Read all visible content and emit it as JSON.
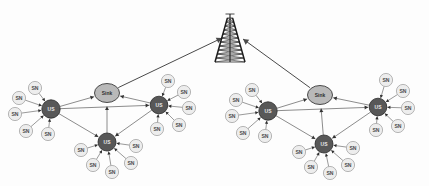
{
  "figure": {
    "background_color": "#fdfdfd",
    "width": 429,
    "height": 186
  },
  "palette": {
    "sn_fill": "#ededed",
    "sn_stroke": "#9a9a9a",
    "us_fill": "#585858",
    "us_stroke": "#2a2a2a",
    "sink_fill": "#b9b9b9",
    "sink_stroke": "#3a3a3a",
    "link_color": "#6f6f6f",
    "uplink_color": "#4a4a4a",
    "tower_color": "#1c1c1c",
    "sn_text": "#4a4a4a",
    "us_text": "#e8e8e8",
    "sink_text": "#2e2e2e"
  },
  "labels": {
    "sensor_node": "SN",
    "cluster_head": "US",
    "sink": "Sink"
  },
  "tower": {
    "name": "base-station-tower",
    "x": 230,
    "y": 18,
    "height": 44,
    "base_half_width": 15,
    "top_half_width": 2.6,
    "rungs": 11
  },
  "clusters": [
    {
      "id": "left-cluster",
      "sink": {
        "id": "sink-left",
        "x": 107,
        "y": 93,
        "rx": 12.5,
        "ry": 9.5,
        "label": "Sink"
      },
      "uplink_to_tower": {
        "from": "sink-left",
        "to_x": 222,
        "to_y": 38
      },
      "hubs": [
        {
          "id": "us-left-west",
          "label": "US",
          "x": 51,
          "y": 109,
          "r": 9.2,
          "sensors": [
            {
              "label": "SN",
              "x": 35,
              "y": 88
            },
            {
              "label": "SN",
              "x": 19,
              "y": 98
            },
            {
              "label": "SN",
              "x": 15,
              "y": 114
            },
            {
              "label": "SN",
              "x": 26,
              "y": 131
            },
            {
              "label": "SN",
              "x": 48,
              "y": 134
            }
          ]
        },
        {
          "id": "us-left-east",
          "label": "US",
          "x": 159,
          "y": 105,
          "r": 8.8,
          "sensors": [
            {
              "label": "SN",
              "x": 168,
              "y": 81
            },
            {
              "label": "SN",
              "x": 184,
              "y": 92
            },
            {
              "label": "SN",
              "x": 189,
              "y": 108
            },
            {
              "label": "SN",
              "x": 179,
              "y": 125
            },
            {
              "label": "SN",
              "x": 157,
              "y": 129
            }
          ]
        },
        {
          "id": "us-left-south",
          "label": "US",
          "x": 107,
          "y": 142,
          "r": 9.0,
          "sensors": [
            {
              "label": "SN",
              "x": 81,
              "y": 150
            },
            {
              "label": "SN",
              "x": 93,
              "y": 165
            },
            {
              "label": "SN",
              "x": 112,
              "y": 172
            },
            {
              "label": "SN",
              "x": 131,
              "y": 163
            },
            {
              "label": "SN",
              "x": 136,
              "y": 146
            }
          ]
        }
      ],
      "hub_links": [
        {
          "from": "us-left-west",
          "to": "sink-left"
        },
        {
          "from": "us-left-west",
          "to": "us-left-east"
        },
        {
          "from": "us-left-west",
          "to": "us-left-south"
        },
        {
          "from": "us-left-east",
          "to": "sink-left"
        },
        {
          "from": "us-left-east",
          "to": "us-left-south"
        },
        {
          "from": "us-left-south",
          "to": "sink-left"
        }
      ]
    },
    {
      "id": "right-cluster",
      "sink": {
        "id": "sink-right",
        "x": 320,
        "y": 95,
        "rx": 12.5,
        "ry": 9.5,
        "label": "Sink"
      },
      "uplink_to_tower": {
        "from": "sink-right",
        "to_x": 243,
        "to_y": 39
      },
      "hubs": [
        {
          "id": "us-right-west",
          "label": "US",
          "x": 268,
          "y": 111,
          "r": 9.2,
          "sensors": [
            {
              "label": "SN",
              "x": 252,
              "y": 90
            },
            {
              "label": "SN",
              "x": 236,
              "y": 100
            },
            {
              "label": "SN",
              "x": 232,
              "y": 116
            },
            {
              "label": "SN",
              "x": 243,
              "y": 133
            },
            {
              "label": "SN",
              "x": 265,
              "y": 136
            }
          ]
        },
        {
          "id": "us-right-east",
          "label": "US",
          "x": 378,
          "y": 107,
          "r": 8.8,
          "sensors": [
            {
              "label": "SN",
              "x": 386,
              "y": 80
            },
            {
              "label": "SN",
              "x": 403,
              "y": 91
            },
            {
              "label": "SN",
              "x": 408,
              "y": 108
            },
            {
              "label": "SN",
              "x": 398,
              "y": 126
            },
            {
              "label": "SN",
              "x": 376,
              "y": 130
            }
          ]
        },
        {
          "id": "us-right-south",
          "label": "US",
          "x": 324,
          "y": 144,
          "r": 9.0,
          "sensors": [
            {
              "label": "SN",
              "x": 299,
              "y": 152
            },
            {
              "label": "SN",
              "x": 311,
              "y": 167
            },
            {
              "label": "SN",
              "x": 330,
              "y": 173
            },
            {
              "label": "SN",
              "x": 348,
              "y": 165
            },
            {
              "label": "SN",
              "x": 353,
              "y": 148
            }
          ]
        }
      ],
      "hub_links": [
        {
          "from": "us-right-west",
          "to": "sink-right"
        },
        {
          "from": "us-right-west",
          "to": "us-right-east"
        },
        {
          "from": "us-right-west",
          "to": "us-right-south"
        },
        {
          "from": "us-right-east",
          "to": "sink-right"
        },
        {
          "from": "us-right-east",
          "to": "us-right-south"
        },
        {
          "from": "us-right-south",
          "to": "sink-right"
        }
      ]
    }
  ]
}
